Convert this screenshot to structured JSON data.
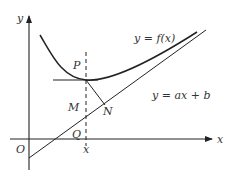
{
  "diagram": {
    "type": "function-graph",
    "axes": {
      "x_label": "x",
      "y_label": "y",
      "origin_label": "O"
    },
    "curves": {
      "curve_label": "y = f(x)",
      "line_label": "y = ax + b"
    },
    "points": {
      "P": "P",
      "M": "M",
      "N": "N",
      "Q": "Q",
      "x_tick": "x"
    },
    "colors": {
      "stroke": "#222222",
      "text": "#333333",
      "background": "#ffffff"
    }
  }
}
